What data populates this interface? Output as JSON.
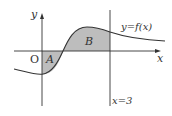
{
  "diagram": {
    "axes": {
      "x_label": "x",
      "y_label": "y",
      "origin_label": "O"
    },
    "curve_label": "y=f(x)",
    "vertical_line_label": "x=3",
    "regions": [
      {
        "label": "A",
        "description": "shaded region below x-axis between y-axis and curve"
      },
      {
        "label": "B",
        "description": "shaded region above x-axis between curve root and x=3"
      }
    ],
    "colors": {
      "shade": "#bdbdbd",
      "line": "#333333"
    }
  }
}
